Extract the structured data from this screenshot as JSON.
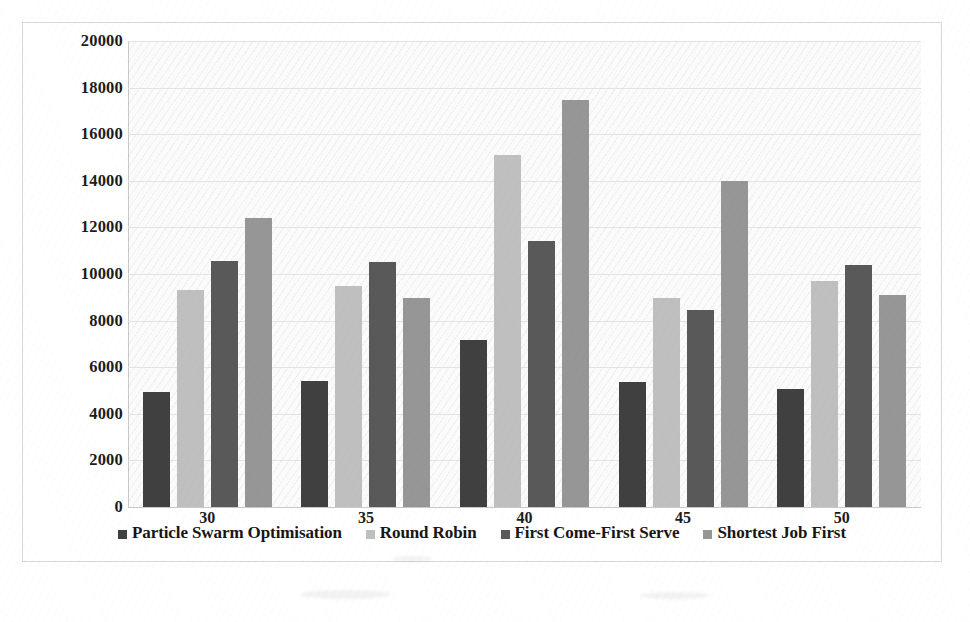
{
  "chart_data": {
    "type": "bar",
    "title": "",
    "subtitle": "",
    "xlabel": "",
    "ylabel": "",
    "categories": [
      "30",
      "35",
      "40",
      "45",
      "50"
    ],
    "ylim": [
      0,
      20000
    ],
    "ytick_values": [
      0,
      2000,
      4000,
      6000,
      8000,
      10000,
      12000,
      14000,
      16000,
      18000,
      20000
    ],
    "ytick_labels": [
      "0",
      "2000",
      "4000",
      "6000",
      "8000",
      "10000",
      "12000",
      "14000",
      "16000",
      "18000",
      "20000"
    ],
    "grid": "horizontal",
    "legend_position": "bottom",
    "series": [
      {
        "name": "Particle Swarm Optimisation",
        "color": "#404040",
        "values": [
          4950,
          5400,
          7150,
          5350,
          5050
        ]
      },
      {
        "name": "Round Robin",
        "color": "#bfbfbf",
        "values": [
          9300,
          9500,
          15100,
          8950,
          9700
        ]
      },
      {
        "name": "First Come-First Serve",
        "color": "#595959",
        "values": [
          10550,
          10500,
          11400,
          8450,
          10400
        ]
      },
      {
        "name": "Shortest Job First",
        "color": "#969696",
        "values": [
          12400,
          8950,
          17450,
          14000,
          9100
        ]
      }
    ]
  }
}
